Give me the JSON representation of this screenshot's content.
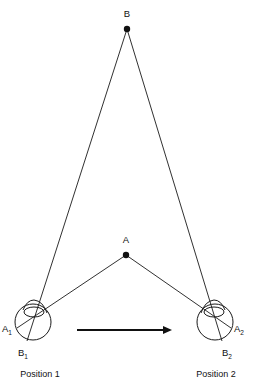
{
  "figure": {
    "type": "geometric-optics-diagram",
    "background_color": "#ffffff",
    "line_color": "#1a1a1a"
  },
  "points": {
    "B": {
      "label": "B",
      "x": 127,
      "y": 29,
      "label_x": 127,
      "label_y": 14
    },
    "A": {
      "label": "A",
      "x": 126,
      "y": 255,
      "label_x": 126,
      "label_y": 240
    }
  },
  "eyes": [
    {
      "id": "eye-1",
      "position_label": "Position 1",
      "position_label_x": 40,
      "position_label_y": 374,
      "center_x": 33,
      "center_y": 322,
      "radius": 18,
      "cornea_cx": 34,
      "cornea_cy": 312,
      "cornea_rx": 10,
      "cornea_ry": 5,
      "image_points": [
        {
          "label": "A",
          "subscript": "1",
          "label_x": 9,
          "label_y": 329,
          "edge_x": 18,
          "edge_y": 328
        },
        {
          "label": "B",
          "subscript": "1",
          "label_x": 25,
          "label_y": 352,
          "edge_x": 27,
          "edge_y": 340
        }
      ]
    },
    {
      "id": "eye-2",
      "position_label": "Position 2",
      "position_label_x": 216,
      "position_label_y": 374,
      "center_x": 215,
      "center_y": 322,
      "radius": 18,
      "cornea_cx": 214,
      "cornea_cy": 312,
      "cornea_rx": 10,
      "cornea_ry": 5,
      "image_points": [
        {
          "label": "A",
          "subscript": "2",
          "label_x": 240,
          "label_y": 329,
          "edge_x": 230,
          "edge_y": 328
        },
        {
          "label": "B",
          "subscript": "2",
          "label_x": 228,
          "label_y": 352,
          "edge_x": 222,
          "edge_y": 340
        }
      ]
    }
  ],
  "sight_lines": [
    {
      "name": "eye1-to-B",
      "from": "B1",
      "x1": 27,
      "y1": 340,
      "x2": 127,
      "y2": 29
    },
    {
      "name": "eye2-to-B",
      "from": "B2",
      "x1": 222,
      "y1": 340,
      "x2": 127,
      "y2": 29
    },
    {
      "name": "eye1-to-A",
      "from": "A1",
      "x1": 18,
      "y1": 328,
      "x2": 126,
      "y2": 255
    },
    {
      "name": "eye2-to-A",
      "from": "A2",
      "x1": 230,
      "y1": 328,
      "x2": 126,
      "y2": 255
    }
  ],
  "motion_arrow": {
    "name": "translation-arrow",
    "x1": 77,
    "y1": 330,
    "x2": 172,
    "y2": 330,
    "direction": "right"
  }
}
